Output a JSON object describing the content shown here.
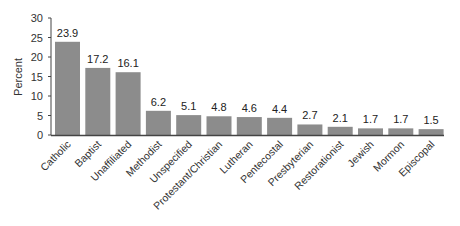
{
  "chart_data": {
    "type": "bar",
    "title": "",
    "xlabel": "",
    "ylabel": "Percent",
    "ylim": [
      0,
      30
    ],
    "yticks": [
      0,
      5,
      10,
      15,
      20,
      25,
      30
    ],
    "grid": false,
    "legend": null,
    "categories": [
      "Catholic",
      "Baptist",
      "Unaffiliated",
      "Methodist",
      "Unspecified",
      "Protestant/Christian",
      "Lutheran",
      "Pentecostal",
      "Presbyterian",
      "Restorationist",
      "Jewish",
      "Mormon",
      "Episcopal"
    ],
    "values": [
      23.9,
      17.2,
      16.1,
      6.2,
      5.1,
      4.8,
      4.6,
      4.4,
      2.7,
      2.1,
      1.7,
      1.7,
      1.5
    ],
    "data_labels": [
      "23.9",
      "17.2",
      "16.1",
      "6.2",
      "5.1",
      "4.8",
      "4.6",
      "4.4",
      "2.7",
      "2.1",
      "1.7",
      "1.7",
      "1.5"
    ],
    "bar_color": "#8c8c8c",
    "axis_color": "#444444"
  }
}
